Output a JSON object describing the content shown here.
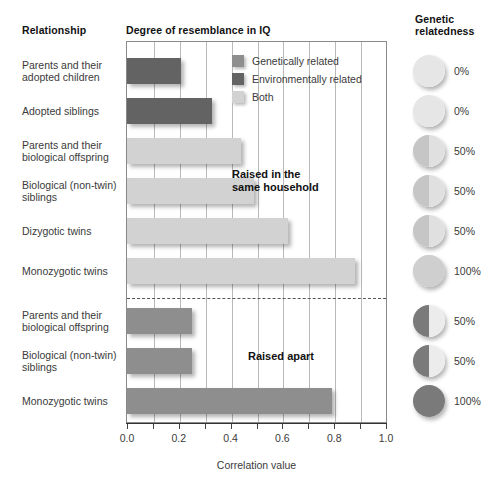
{
  "headers": {
    "relationship": "Relationship",
    "degree": "Degree of resemblance in IQ",
    "genetic": "Genetic relatedness"
  },
  "legend": {
    "items": [
      {
        "label": "Genetically related",
        "color": "#8e8e8e",
        "key": "gen"
      },
      {
        "label": "Environmentally related",
        "color": "#636363",
        "key": "env"
      },
      {
        "label": "Both",
        "color": "#d2d2d2",
        "key": "both"
      }
    ]
  },
  "annotations": {
    "household": "Raised in the same household",
    "apart": "Raised apart"
  },
  "axis": {
    "label": "Correlation value",
    "ticks": [
      "0.0",
      "0.2",
      "0.4",
      "0.6",
      "0.8",
      "1.0"
    ],
    "min": 0,
    "max": 1
  },
  "genetic_relatedness": {
    "title": "Genetic relatedness",
    "values": [
      "0%",
      "0%",
      "50%",
      "50%",
      "50%",
      "100%",
      "50%",
      "50%",
      "100%"
    ]
  },
  "chart_data": {
    "type": "bar",
    "orientation": "horizontal",
    "title": "Degree of resemblance in IQ",
    "xlabel": "Correlation value",
    "ylabel": "Relationship",
    "xlim": [
      0.0,
      1.0
    ],
    "xticks": [
      0.0,
      0.2,
      0.4,
      0.6,
      0.8,
      1.0
    ],
    "grid": true,
    "legend_position": "inside-top-right",
    "groups": [
      {
        "name": "Raised in the same household",
        "bars": [
          {
            "category": "Parents and their adopted children",
            "value": 0.21,
            "series": "Environmentally related",
            "color": "#636363",
            "genetic_relatedness": "0%"
          },
          {
            "category": "Adopted siblings",
            "value": 0.33,
            "series": "Environmentally related",
            "color": "#636363",
            "genetic_relatedness": "0%"
          },
          {
            "category": "Parents and their biological offspring",
            "value": 0.44,
            "series": "Both",
            "color": "#d2d2d2",
            "genetic_relatedness": "50%"
          },
          {
            "category": "Biological (non-twin) siblings",
            "value": 0.49,
            "series": "Both",
            "color": "#d2d2d2",
            "genetic_relatedness": "50%"
          },
          {
            "category": "Dizygotic twins",
            "value": 0.62,
            "series": "Both",
            "color": "#d2d2d2",
            "genetic_relatedness": "50%"
          },
          {
            "category": "Monozygotic twins",
            "value": 0.88,
            "series": "Both",
            "color": "#d2d2d2",
            "genetic_relatedness": "100%"
          }
        ]
      },
      {
        "name": "Raised apart",
        "bars": [
          {
            "category": "Parents and their biological offspring",
            "value": 0.25,
            "series": "Genetically related",
            "color": "#8e8e8e",
            "genetic_relatedness": "50%"
          },
          {
            "category": "Biological (non-twin) siblings",
            "value": 0.25,
            "series": "Genetically related",
            "color": "#8e8e8e",
            "genetic_relatedness": "50%"
          },
          {
            "category": "Monozygotic twins",
            "value": 0.79,
            "series": "Genetically related",
            "color": "#8e8e8e",
            "genetic_relatedness": "100%"
          }
        ]
      }
    ]
  }
}
